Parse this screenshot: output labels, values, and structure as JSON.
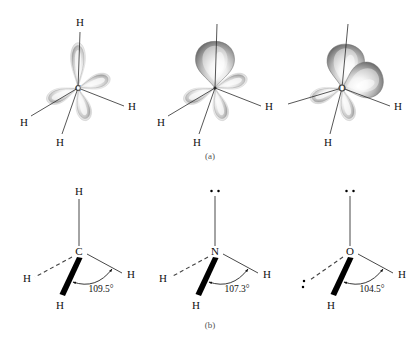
{
  "figure": {
    "panels": [
      {
        "id": "a",
        "label": "(a)",
        "caption_position": "below-row-1"
      },
      {
        "id": "b",
        "label": "(b)",
        "caption_position": "below-row-2"
      }
    ]
  },
  "row_a": {
    "description": "sp3 hybrid orbital lobe representations",
    "molecules": [
      {
        "name": "methane-orbitals",
        "center_atom": "C",
        "center_label": "C",
        "hydrogen_labels": [
          "H",
          "H",
          "H",
          "H"
        ],
        "lone_pair_lobes": 0,
        "bonding_lobes": 4
      },
      {
        "name": "ammonia-orbitals",
        "center_atom": "N",
        "center_label": "",
        "hydrogen_labels": [
          "H",
          "H",
          "H"
        ],
        "lone_pair_lobes": 1,
        "bonding_lobes": 3
      },
      {
        "name": "water-orbitals",
        "center_atom": "O",
        "center_label": "O",
        "hydrogen_labels": [
          "H",
          "H"
        ],
        "lone_pair_lobes": 2,
        "bonding_lobes": 2
      }
    ]
  },
  "row_b": {
    "description": "bond angle line structures",
    "molecules": [
      {
        "name": "methane-structure",
        "center_label": "C",
        "top_label": "H",
        "left_label": "H",
        "right_label": "H",
        "bottom_label": "H",
        "angle": "109.5°",
        "lone_pair_top": false,
        "lone_pair_left": false
      },
      {
        "name": "ammonia-structure",
        "center_label": "N",
        "top_label": "",
        "left_label": "H",
        "right_label": "H",
        "bottom_label": "H",
        "angle": "107.3°",
        "lone_pair_top": true,
        "lone_pair_left": false
      },
      {
        "name": "water-structure",
        "center_label": "O",
        "top_label": "",
        "left_label": "",
        "right_label": "H",
        "bottom_label": "H",
        "angle": "104.5°",
        "lone_pair_top": true,
        "lone_pair_left": true
      }
    ]
  },
  "colors": {
    "background": "#ffffff",
    "ink": "#111111",
    "lobe_light": "#f2f2f2",
    "lobe_mid": "#bdbdbd",
    "lobe_dark": "#6e6e6e",
    "caption": "#555555"
  }
}
